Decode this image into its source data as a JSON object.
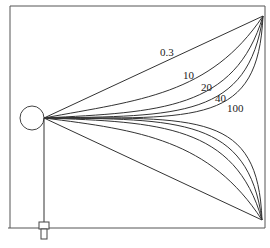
{
  "diagram": {
    "type": "field-line diagram",
    "source": {
      "shape": "circle",
      "cx": 32,
      "cy": 118,
      "r": 12
    },
    "curve_labels": [
      {
        "text": "0.3",
        "x": 160,
        "y": 56
      },
      {
        "text": "10",
        "x": 183,
        "y": 79
      },
      {
        "text": "20",
        "x": 201,
        "y": 91
      },
      {
        "text": "40",
        "x": 215,
        "y": 102
      },
      {
        "text": "100",
        "x": 227,
        "y": 112
      }
    ],
    "colors": {
      "line": "#333333",
      "frame": "#555555",
      "background": "#ffffff"
    }
  }
}
